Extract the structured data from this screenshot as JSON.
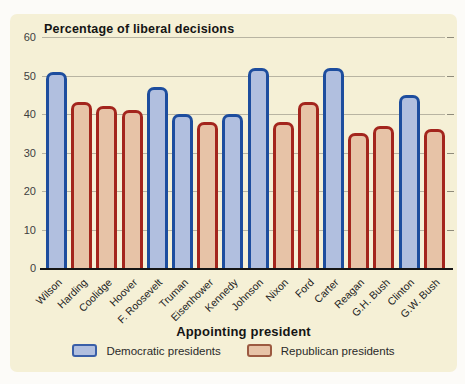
{
  "chart_data": {
    "type": "bar",
    "title": "Percentage of liberal decisions",
    "xlabel": "Appointing president",
    "ylabel": "",
    "ylim": [
      0,
      60
    ],
    "yticks": [
      0,
      10,
      20,
      30,
      40,
      50,
      60
    ],
    "grid": true,
    "legend_position": "bottom",
    "categories": [
      "Wilson",
      "Harding",
      "Coolidge",
      "Hoover",
      "F. Roosevelt",
      "Truman",
      "Eisenhower",
      "Kennedy",
      "Johnson",
      "Nixon",
      "Ford",
      "Carter",
      "Reagan",
      "G.H. Bush",
      "Clinton",
      "G.W. Bush"
    ],
    "values": [
      51,
      43,
      42,
      41,
      47,
      40,
      38,
      40,
      52,
      38,
      43,
      52,
      35,
      37,
      45,
      36
    ],
    "parties": [
      "D",
      "R",
      "R",
      "R",
      "D",
      "D",
      "R",
      "D",
      "D",
      "R",
      "R",
      "D",
      "R",
      "R",
      "D",
      "R"
    ],
    "legend": [
      {
        "label": "Democratic presidents",
        "party": "D"
      },
      {
        "label": "Republican presidents",
        "party": "R"
      }
    ],
    "colors": {
      "democratic_fill": "#b1bfdf",
      "democratic_border": "#1d4d9e",
      "republican_fill": "#e7c3a7",
      "republican_border": "#a3251d",
      "legend_democratic_border": "#3a5fa8",
      "legend_republican_border": "#9c5a41",
      "panel_background": "#f5f0d6",
      "gridline": "#b8b4a2",
      "axis": "#151515"
    }
  }
}
